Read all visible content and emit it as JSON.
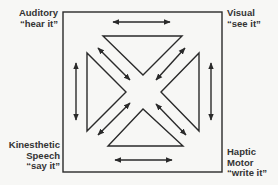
{
  "diagram": {
    "type": "multisensory-learning-square",
    "corners": {
      "top_left": {
        "lines": [
          "Auditory",
          "“hear it”"
        ]
      },
      "top_right": {
        "lines": [
          "Visual",
          "“see it”"
        ]
      },
      "bottom_left": {
        "lines": [
          "Kinesthetic",
          "Speech",
          "“say it”"
        ]
      },
      "bottom_right": {
        "lines": [
          "Haptic",
          "Motor",
          "“write it”"
        ]
      }
    },
    "connections": [
      {
        "from": "Auditory",
        "to": "Visual",
        "style": "double-arrow",
        "position": "top"
      },
      {
        "from": "Kinesthetic",
        "to": "Haptic",
        "style": "double-arrow",
        "position": "bottom"
      },
      {
        "from": "Auditory",
        "to": "Kinesthetic",
        "style": "double-arrow",
        "position": "left"
      },
      {
        "from": "Visual",
        "to": "Haptic",
        "style": "double-arrow",
        "position": "right"
      },
      {
        "from": "Auditory",
        "to": "Haptic",
        "style": "double-arrow",
        "position": "diagonal"
      },
      {
        "from": "Visual",
        "to": "Kinesthetic",
        "style": "double-arrow",
        "position": "diagonal"
      }
    ],
    "colors": {
      "line": "#2a2a2a",
      "background": "#f7f7f5"
    }
  }
}
